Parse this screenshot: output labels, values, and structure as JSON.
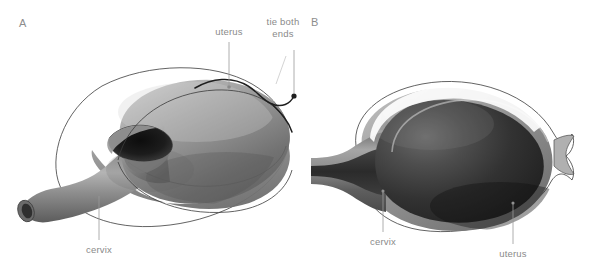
{
  "figure": {
    "background_color": "#ffffff",
    "panels": [
      {
        "id": "A",
        "letter": "A",
        "view": "three-quarter exterior view of uterus with incision and ligature",
        "annotations": [
          {
            "name": "uterus",
            "label": "uterus"
          },
          {
            "name": "tie-both-ends-line1",
            "label": "tie both"
          },
          {
            "name": "tie-both-ends-line2",
            "label": "ends"
          },
          {
            "name": "cervix",
            "label": "cervix"
          }
        ]
      },
      {
        "id": "B",
        "letter": "B",
        "view": "sagittal cross-section of uterus showing cervical canal and cavity",
        "annotations": [
          {
            "name": "cervix",
            "label": "cervix"
          },
          {
            "name": "uterus",
            "label": "uterus"
          }
        ]
      }
    ],
    "colors": {
      "tissue_light": "#b9b9b9",
      "tissue_mid": "#8a8a8a",
      "tissue_dark": "#5e5e5e",
      "cavity_dark": "#262626",
      "outline": "#3b3b3b",
      "label_text": "#8a8a8a",
      "leader_line": "#9a9a9a",
      "suture": "#1f1f1f"
    }
  }
}
